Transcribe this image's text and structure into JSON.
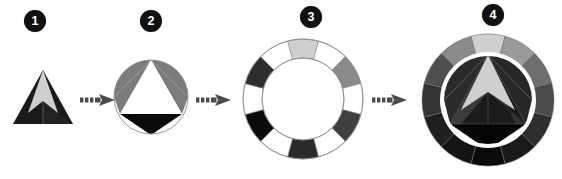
{
  "diagram": {
    "background_color": "#ffffff",
    "width": 562,
    "height": 179,
    "palette": {
      "badge_fill": "#111111",
      "badge_text": "#ffffff",
      "light_gray": "#cfcfcf",
      "mid_gray": "#7b7b7b",
      "dark_gray": "#3f3f3f",
      "black": "#0b0b0b",
      "white": "#ffffff",
      "outline": "#8a8a8a",
      "arrow_color": "#4a4a4a"
    },
    "steps": [
      {
        "number": "1",
        "name": "triangle",
        "label": "triangle with light chevron apex and dark base wings",
        "badge_x": 24,
        "badge_y": 10,
        "fig_x": 12,
        "fig_y": 68,
        "fig_w": 62,
        "fig_h": 58
      },
      {
        "number": "2",
        "name": "circumscribed-triangle",
        "label": "triangle inscribed in circle with gray corner segments and black base cap",
        "badge_x": 140,
        "badge_y": 10,
        "fig_x": 112,
        "fig_y": 58,
        "fig_w": 78,
        "fig_h": 78
      },
      {
        "number": "3",
        "name": "segmented-ring",
        "label": "twelve segment annulus alternating white, gray, dark gray and black",
        "badge_x": 300,
        "badge_y": 6,
        "fig_x": 241,
        "fig_y": 37,
        "fig_w": 124,
        "fig_h": 124
      },
      {
        "number": "4",
        "name": "composite-wheel",
        "label": "ring combined with inscribed triangle forming full emblem",
        "badge_x": 482,
        "badge_y": 4,
        "fig_x": 420,
        "fig_y": 32,
        "fig_w": 136,
        "fig_h": 136
      }
    ],
    "arrows": [
      {
        "name": "arrow-1-to-2",
        "x": 80,
        "y": 92,
        "w": 36,
        "h": 16
      },
      {
        "name": "arrow-2-to-3",
        "x": 196,
        "y": 92,
        "w": 36,
        "h": 16
      },
      {
        "name": "arrow-3-to-4",
        "x": 372,
        "y": 92,
        "w": 36,
        "h": 16
      }
    ],
    "ring_segments": {
      "count": 12,
      "colors": [
        "#cfcfcf",
        "#ffffff",
        "#8a8a8a",
        "#ffffff",
        "#3f3f3f",
        "#ffffff",
        "#2a2a2a",
        "#ffffff",
        "#0b0b0b",
        "#ffffff",
        "#2e2e2e",
        "#ffffff"
      ]
    },
    "composite_ring_segments": {
      "count": 12,
      "colors": [
        "#cfcfcf",
        "#9a9a9a",
        "#6e6e6e",
        "#4a4a4a",
        "#2e2e2e",
        "#1a1a1a",
        "#0b0b0b",
        "#141414",
        "#1f1f1f",
        "#333333",
        "#4f4f4f",
        "#8a8a8a"
      ]
    }
  }
}
